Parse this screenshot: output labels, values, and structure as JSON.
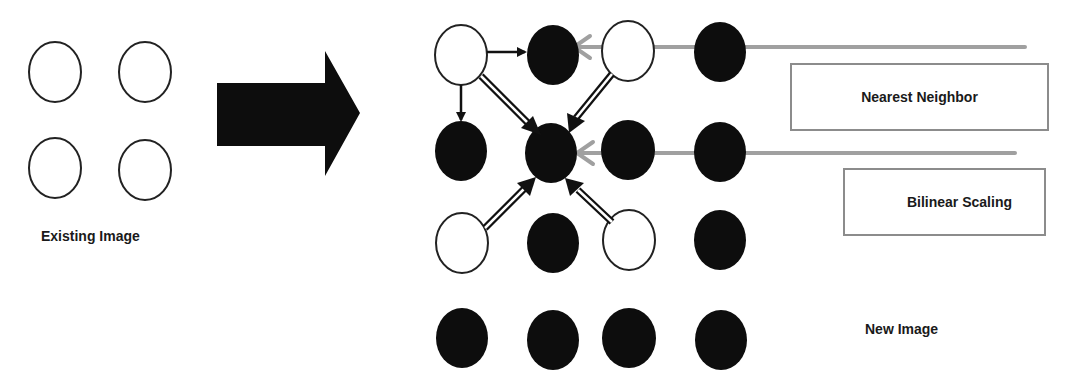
{
  "labels": {
    "existing_image": "Existing Image",
    "new_image": "New Image",
    "nearest_neighbor": "Nearest Neighbor",
    "bilinear_scaling": "Bilinear Scaling"
  },
  "colors": {
    "pixel_existing": "#ffffff",
    "pixel_new": "#000000",
    "outline": "#222222",
    "pointer_line": "#a0a0a0",
    "box_border": "#8c8c8c"
  },
  "existing_image": {
    "grid": [
      [
        "white",
        "white"
      ],
      [
        "white",
        "white"
      ]
    ]
  },
  "new_image": {
    "grid": [
      [
        "white",
        "black",
        "white",
        "black"
      ],
      [
        "black",
        "black",
        "black",
        "black"
      ],
      [
        "white",
        "black",
        "white",
        "black"
      ],
      [
        "black",
        "black",
        "black",
        "black"
      ]
    ]
  }
}
